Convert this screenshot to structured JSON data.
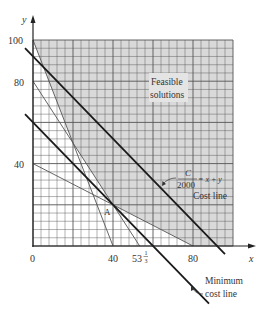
{
  "chart_data": {
    "type": "line",
    "title": "",
    "xlabel": "x",
    "ylabel": "y",
    "xlim": [
      0,
      100
    ],
    "ylim": [
      0,
      100
    ],
    "grid": true,
    "grid_minor_step": 4,
    "grid_major_step": 20,
    "x_tick_labels": [
      {
        "value": 0,
        "label": "0"
      },
      {
        "value": 40,
        "label": "40"
      },
      {
        "value": 53.333,
        "label": "53⅓"
      },
      {
        "value": 80,
        "label": "80"
      }
    ],
    "y_tick_labels": [
      {
        "value": 40,
        "label": "40"
      },
      {
        "value": 80,
        "label": "80"
      },
      {
        "value": 100,
        "label": "100"
      }
    ],
    "constraint_lines": [
      {
        "name": "5x + 2y = 200",
        "points": [
          [
            0,
            100
          ],
          [
            40,
            0
          ]
        ],
        "weight": "thin"
      },
      {
        "name": "3x + 2y = 160",
        "points": [
          [
            0,
            80
          ],
          [
            53.333,
            0
          ]
        ],
        "weight": "thin"
      },
      {
        "name": "x + 2y = 80",
        "points": [
          [
            0,
            40
          ],
          [
            80,
            0
          ]
        ],
        "weight": "thin"
      }
    ],
    "cost_lines": [
      {
        "name": "Cost line",
        "equation": "x + y = 92",
        "points": [
          [
            -4,
            96
          ],
          [
            96,
            -4
          ]
        ],
        "weight": "bold"
      },
      {
        "name": "Minimum cost line",
        "equation": "x + y = 60",
        "points": [
          [
            -4,
            64
          ],
          [
            88,
            -28
          ]
        ],
        "weight": "bold"
      }
    ],
    "feasible_region": {
      "label": "Feasible solutions",
      "vertices": [
        [
          0,
          100
        ],
        [
          20,
          50
        ],
        [
          40,
          20
        ],
        [
          80,
          0
        ],
        [
          100,
          0
        ],
        [
          100,
          100
        ]
      ],
      "fill": "#d9d9d9"
    },
    "points": [
      {
        "label": "A",
        "x": 40,
        "y": 20
      }
    ],
    "annotations": [
      {
        "text": "Feasible",
        "x": 76,
        "y": 82
      },
      {
        "text": "solutions",
        "x": 76,
        "y": 75
      },
      {
        "text_top": "C",
        "text_bottom": "2000",
        "text_right": "= x + y",
        "x": 72,
        "y": 28
      },
      {
        "text": "Cost line",
        "x": 85,
        "y": 22
      },
      {
        "text": "Minimum",
        "x": 103,
        "y": -22
      },
      {
        "text": "cost line",
        "x": 103,
        "y": -29
      }
    ]
  },
  "labels": {
    "y_axis": "y",
    "x_axis": "x",
    "y100": "100",
    "y80": "80",
    "y40": "40",
    "x0": "0",
    "x40": "40",
    "x53_whole": "53",
    "x53_num": "1",
    "x53_den": "3",
    "x80": "80",
    "point_a": "A",
    "feasible_1": "Feasible",
    "feasible_2": "solutions",
    "cost_c": "C",
    "cost_2000": "2000",
    "cost_eq": "= x + y",
    "cost_line": "Cost line",
    "min_1": "Minimum",
    "min_2": "cost line"
  },
  "colors": {
    "feasible_fill": "#d9d9d9",
    "grid": "#555555",
    "line": "#222222",
    "text": "#333333"
  }
}
